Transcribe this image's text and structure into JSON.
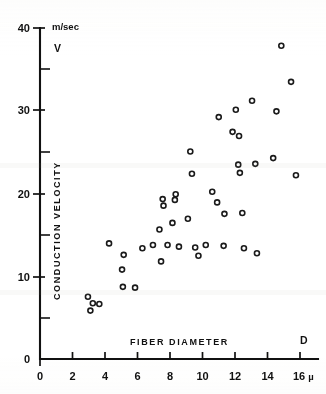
{
  "chart_data": {
    "type": "scatter",
    "title": "",
    "xlabel": "FIBER DIAMETER",
    "ylabel": "CONDUCTION VELOCITY",
    "x_axis_symbol": "D",
    "y_axis_symbol": "V",
    "y_unit": "m/sec",
    "x_unit": "µ",
    "xlim": [
      0,
      17
    ],
    "ylim": [
      0,
      41
    ],
    "x_ticks": [
      0,
      2,
      4,
      6,
      8,
      10,
      12,
      14,
      16
    ],
    "x_tick_labels": [
      "0",
      "2",
      "4",
      "6",
      "8",
      "10",
      "12",
      "14",
      "16"
    ],
    "y_ticks": [
      0,
      10,
      20,
      30,
      40
    ],
    "y_tick_labels": [
      "0",
      "10",
      "20",
      "30",
      "40"
    ],
    "y_minor_ticks": [
      5,
      15,
      25,
      35
    ],
    "grid": false,
    "legend": "none",
    "points": [
      [
        2.95,
        7.6
      ],
      [
        3.25,
        6.8
      ],
      [
        3.65,
        6.7
      ],
      [
        3.1,
        5.9
      ],
      [
        4.25,
        14.1
      ],
      [
        5.15,
        12.7
      ],
      [
        5.05,
        10.9
      ],
      [
        5.1,
        8.8
      ],
      [
        5.85,
        8.7
      ],
      [
        6.3,
        13.5
      ],
      [
        6.95,
        13.9
      ],
      [
        7.35,
        15.8
      ],
      [
        7.55,
        19.5
      ],
      [
        7.6,
        18.7
      ],
      [
        7.45,
        11.9
      ],
      [
        7.85,
        13.9
      ],
      [
        8.35,
        20.1
      ],
      [
        8.3,
        19.4
      ],
      [
        8.15,
        16.6
      ],
      [
        8.55,
        13.7
      ],
      [
        9.1,
        17.1
      ],
      [
        9.35,
        22.6
      ],
      [
        9.25,
        25.3
      ],
      [
        9.55,
        13.6
      ],
      [
        9.75,
        12.6
      ],
      [
        10.2,
        13.9
      ],
      [
        10.6,
        20.4
      ],
      [
        10.9,
        19.1
      ],
      [
        11.0,
        29.5
      ],
      [
        11.3,
        13.8
      ],
      [
        11.35,
        17.7
      ],
      [
        11.85,
        27.7
      ],
      [
        12.05,
        30.4
      ],
      [
        12.25,
        27.2
      ],
      [
        12.2,
        23.7
      ],
      [
        12.3,
        22.7
      ],
      [
        12.45,
        17.8
      ],
      [
        12.55,
        13.5
      ],
      [
        13.05,
        31.5
      ],
      [
        13.25,
        23.8
      ],
      [
        13.35,
        12.9
      ],
      [
        14.35,
        24.5
      ],
      [
        14.55,
        30.2
      ],
      [
        14.85,
        38.2
      ],
      [
        15.45,
        33.8
      ],
      [
        15.75,
        22.4
      ]
    ],
    "n_points": 46,
    "marker": "open-circle"
  }
}
